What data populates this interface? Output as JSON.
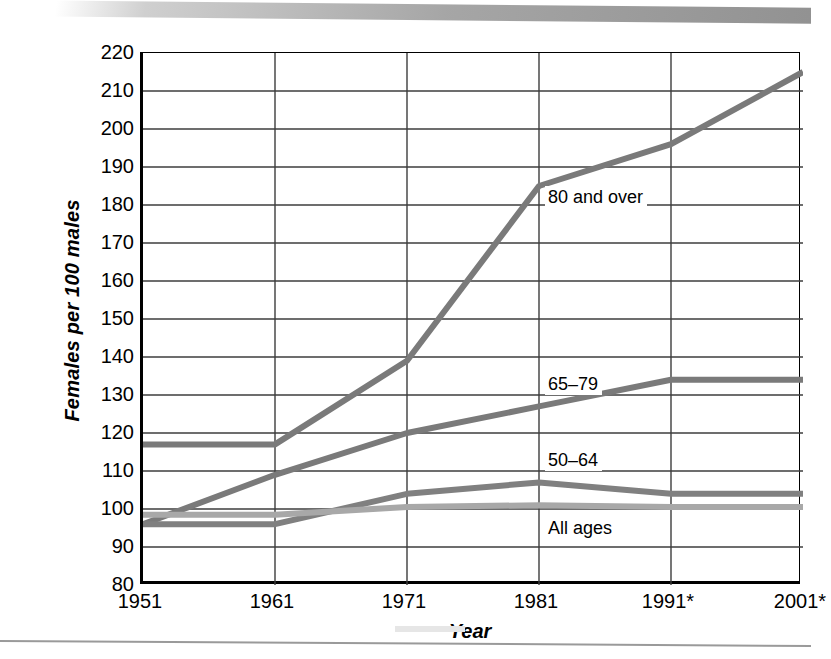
{
  "chart_data": {
    "type": "line",
    "title": "",
    "xlabel": "Year",
    "ylabel": "Females per 100 males",
    "x": [
      1951,
      1961,
      1971,
      1981,
      1991,
      2001
    ],
    "categories": [
      "1951",
      "1961",
      "1971",
      "1981",
      "1991*",
      "2001*"
    ],
    "xlim": [
      1951,
      2001
    ],
    "ylim": [
      80,
      220
    ],
    "ytick_step": 10,
    "yticks": [
      220,
      210,
      200,
      190,
      180,
      170,
      160,
      150,
      140,
      130,
      120,
      110,
      100,
      90,
      80
    ],
    "grid": "horizontal-and-vertical",
    "legend_position": "inline-annotations",
    "series": [
      {
        "name": "80 and over",
        "label": "80 and over",
        "color": "#7a7a7a",
        "values": [
          117,
          117,
          139,
          185,
          196,
          215
        ],
        "annotation": {
          "x_year": 1981,
          "y_value": 182
        }
      },
      {
        "name": "65-79",
        "label": "65–79",
        "color": "#7a7a7a",
        "values": [
          96,
          109,
          120,
          127,
          134,
          134
        ],
        "annotation": {
          "x_year": 1981,
          "y_value": 133
        }
      },
      {
        "name": "50-64",
        "label": "50–64",
        "color": "#808080",
        "values": [
          96,
          96,
          104,
          107,
          104,
          104
        ],
        "annotation": {
          "x_year": 1981,
          "y_value": 113
        }
      },
      {
        "name": "All ages",
        "label": "All ages",
        "color": "#a8a8a8",
        "values": [
          98.5,
          98.5,
          100.5,
          101,
          100.5,
          100.5
        ],
        "annotation": {
          "x_year": 1981,
          "y_value": 95
        }
      }
    ]
  },
  "axes": {
    "y_title": "Females per 100 males",
    "x_title": "Year",
    "y_tick_labels": [
      "220",
      "210",
      "200",
      "190",
      "180",
      "170",
      "160",
      "150",
      "140",
      "130",
      "120",
      "110",
      "100",
      "90",
      "80"
    ],
    "x_tick_labels": [
      "1951",
      "1961",
      "1971",
      "1981",
      "1991*",
      "2001*"
    ]
  },
  "annotations": {
    "a80_and_over": "80 and over",
    "a65_79": "65–79",
    "a50_64": "50–64",
    "a_all_ages": "All ages"
  },
  "colors": {
    "series_dark": "#7a7a7a",
    "series_light": "#a8a8a8",
    "axis": "#000000",
    "gridline": "#3d3d3d",
    "background": "#ffffff"
  }
}
